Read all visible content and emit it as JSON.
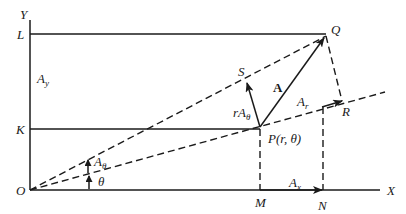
{
  "figure": {
    "axes": {
      "x_label": "X",
      "y_label": "Y",
      "origin_label": "O"
    },
    "points": {
      "O": "O",
      "L": "L",
      "K": "K",
      "M": "M",
      "N": "N",
      "P": "P(r, θ)",
      "Q": "Q",
      "R": "R",
      "S": "S"
    },
    "vectors": {
      "A": "A",
      "Ar": {
        "main": "A",
        "sub": "r"
      },
      "Atheta_scaled": {
        "prefix": "r",
        "main": "A",
        "sub": "θ"
      },
      "Ax": {
        "main": "A",
        "sub": "x"
      },
      "Ay": {
        "main": "A",
        "sub": "y"
      }
    },
    "angles": {
      "theta": "θ",
      "Atheta": {
        "main": "A",
        "sub": "θ"
      }
    },
    "colors": {
      "ink": "#1a1a1a",
      "background": "#ffffff"
    }
  }
}
